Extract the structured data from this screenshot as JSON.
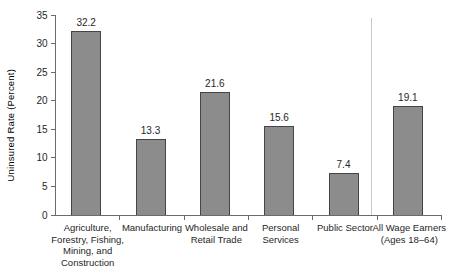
{
  "chart_data": {
    "type": "bar",
    "title": "",
    "xlabel": "",
    "ylabel": "Uninsured Rate (Percent)",
    "ylim": [
      0,
      35
    ],
    "yticks": [
      0,
      5,
      10,
      15,
      20,
      25,
      30,
      35
    ],
    "grid": false,
    "legend": null,
    "categories": [
      "Agriculture,\nForestry, Fishing,\nMining, and\nConstruction",
      "Manufacturing",
      "Wholesale and\nRetail Trade",
      "Personal\nServices",
      "Public Sector",
      "All Wage Earners\n(Ages 18–64)"
    ],
    "values": [
      32.2,
      13.3,
      21.6,
      15.6,
      7.4,
      19.1
    ],
    "value_labels": [
      "32.2",
      "13.3",
      "21.6",
      "15.6",
      "7.4",
      "19.1"
    ],
    "separator_before_index": 5,
    "colors": {
      "bar_fill": "#8c8c8c",
      "bar_border": "#454545",
      "axis": "#6b6b6b",
      "text": "#262626",
      "separator": "#c9c9c9",
      "background": "#ffffff"
    }
  }
}
